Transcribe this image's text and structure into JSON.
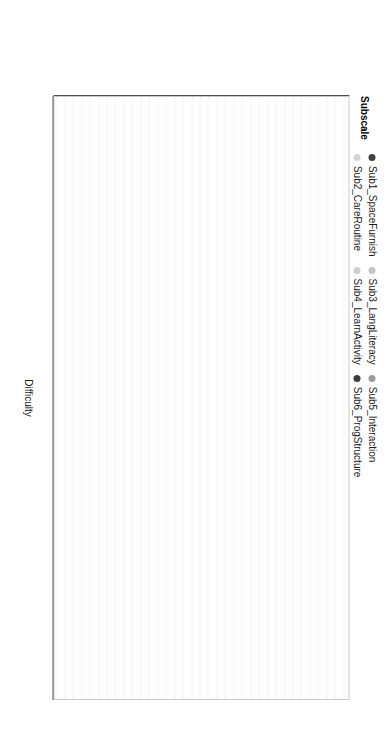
{
  "figure": {
    "xlabel": "Difficulty",
    "xticks": [
      0,
      1,
      2,
      3,
      4
    ],
    "legend_title": "Subscale"
  },
  "legend": {
    "title": "Subscale",
    "entries": [
      {
        "label": "Sub1_SpaceFurnish",
        "color": "#404040"
      },
      {
        "label": "Sub2_CareRoutine",
        "color": "#d4d4d4"
      },
      {
        "label": "Sub3_LangLiteracy",
        "color": "#c4c4c4"
      },
      {
        "label": "Sub4_LearnActivity",
        "color": "#cfcfcf"
      },
      {
        "label": "Sub5_Interaction",
        "color": "#9a9a9a"
      },
      {
        "label": "Sub6_ProgStructure",
        "color": "#3c3c3c"
      }
    ]
  },
  "chart_data": {
    "type": "scatter",
    "title": "",
    "xlabel": "Difficulty",
    "ylabel": "",
    "xlim": [
      -0.75,
      4.45
    ],
    "ylim": [
      0,
      36
    ],
    "grid": true,
    "legend_position": "top",
    "series_key": "Subscale",
    "categories": [
      "Item20_Block",
      "Item22_SScience",
      "Item21_MathNum",
      "Item25_WithNum",
      "Item27_Tech",
      "Item26_Divers",
      "Item19_Dram",
      "Item6_GrossMotSpace",
      "Item5_Display",
      "Item18_Music",
      "Item16_Print",
      "Item2_Furnishing",
      "Item9_Toilet",
      "Item8_Meals",
      "Item3_RoomArrange",
      "Item24_Motor",
      "Item23_Dram2",
      "Item17_Art",
      "Item7_GrossMotEquip",
      "Item15_Vocabulary",
      "Item13_StaffBook",
      "Item34_FreePlay",
      "Item4_Privacy",
      "Item14_EncourCom",
      "Item35_WholeGroupAct",
      "Item12_Logical",
      "Item29_Individualized",
      "Item11_Encourage",
      "Item1_Indoor",
      "Item10_Health",
      "Item28_SuperGrossMot",
      "Item32_Discipline",
      "Item33_Transition",
      "Item30_StaffChildInteract",
      "Item31_PeerInteract"
    ],
    "points": [
      {
        "item": "Item20_Block",
        "difficulty": 4.3,
        "subscale": "Sub4_LearnActivity",
        "color": "#cdcdcd",
        "emphasis": false
      },
      {
        "item": "Item22_SScience",
        "difficulty": 4.22,
        "subscale": "Sub4_LearnActivity",
        "color": "#cdcdcd",
        "emphasis": false
      },
      {
        "item": "Item21_MathNum",
        "difficulty": 4.12,
        "subscale": "Sub4_LearnActivity",
        "color": "#c6c6c6",
        "emphasis": false
      },
      {
        "item": "Item25_WithNum",
        "difficulty": 3.95,
        "subscale": "Sub4_LearnActivity",
        "color": "#c4c4c4",
        "emphasis": false
      },
      {
        "item": "Item27_Tech",
        "difficulty": 3.6,
        "subscale": "Sub4_LearnActivity",
        "color": "#cccccc",
        "emphasis": false
      },
      {
        "item": "Item26_Divers",
        "difficulty": 3.3,
        "subscale": "Sub4_LearnActivity",
        "color": "#c9c9c9",
        "emphasis": false
      },
      {
        "item": "Item19_Dram",
        "difficulty": 3.29,
        "subscale": "Sub6_ProgStructure",
        "color": "#3c3c3c",
        "emphasis": true
      },
      {
        "item": "Item6_GrossMotSpace",
        "difficulty": 3.18,
        "subscale": "Sub6_ProgStructure",
        "color": "#3c3c3c",
        "emphasis": true
      },
      {
        "item": "Item5_Display",
        "difficulty": 2.95,
        "subscale": "Sub2_CareRoutine",
        "color": "#d2d2d2",
        "emphasis": false
      },
      {
        "item": "Item18_Music",
        "difficulty": 2.72,
        "subscale": "Sub4_LearnActivity",
        "color": "#cbcbcb",
        "emphasis": false
      },
      {
        "item": "Item16_Print",
        "difficulty": 2.5,
        "subscale": "Sub5_Interaction",
        "color": "#8f8f8f",
        "emphasis": true
      },
      {
        "item": "Item2_Furnishing",
        "difficulty": 2.42,
        "subscale": "Sub3_LangLiteracy",
        "color": "#c3c3c3",
        "emphasis": false
      },
      {
        "item": "Item9_Toilet",
        "difficulty": 2.39,
        "subscale": "Sub3_LangLiteracy",
        "color": "#c7c7c7",
        "emphasis": false
      },
      {
        "item": "Item8_Meals",
        "difficulty": 2.36,
        "subscale": "Sub2_CareRoutine",
        "color": "#d0d0d0",
        "emphasis": false
      },
      {
        "item": "Item3_RoomArrange",
        "difficulty": 2.33,
        "subscale": "Sub3_LangLiteracy",
        "color": "#c8c8c8",
        "emphasis": false
      },
      {
        "item": "Item24_Motor",
        "difficulty": 2.3,
        "subscale": "Sub5_Interaction",
        "color": "#8c8c8c",
        "emphasis": true
      },
      {
        "item": "Item23_Dram2",
        "difficulty": 2.27,
        "subscale": "Sub2_CareRoutine",
        "color": "#cdcdcd",
        "emphasis": false
      },
      {
        "item": "Item17_Art",
        "difficulty": 2.23,
        "subscale": "Sub4_LearnActivity",
        "color": "#cfcfcf",
        "emphasis": false
      },
      {
        "item": "Item7_GrossMotEquip",
        "difficulty": 1.9,
        "subscale": "Sub6_ProgStructure",
        "color": "#3c3c3c",
        "emphasis": true
      },
      {
        "item": "Item15_Vocabulary",
        "difficulty": 1.86,
        "subscale": "Sub3_LangLiteracy",
        "color": "#c6c6c6",
        "emphasis": false
      },
      {
        "item": "Item13_StaffBook",
        "difficulty": 1.78,
        "subscale": "Sub3_LangLiteracy",
        "color": "#cbcbcb",
        "emphasis": false
      },
      {
        "item": "Item34_FreePlay",
        "difficulty": 1.32,
        "subscale": "Sub1_SpaceFurnish",
        "color": "#404040",
        "emphasis": true
      },
      {
        "item": "Item4_Privacy",
        "difficulty": 1.19,
        "subscale": "Sub1_SpaceFurnish",
        "color": "#404040",
        "emphasis": true
      },
      {
        "item": "Item14_EncourCom",
        "difficulty": 1.15,
        "subscale": "Sub3_LangLiteracy",
        "color": "#c2c2c2",
        "emphasis": false
      },
      {
        "item": "Item35_WholeGroupAct",
        "difficulty": 1.05,
        "subscale": "Sub6_ProgStructure",
        "color": "#3c3c3c",
        "emphasis": true
      },
      {
        "item": "Item12_Logical",
        "difficulty": 1.01,
        "subscale": "Sub3_LangLiteracy",
        "color": "#c4c4c4",
        "emphasis": false
      },
      {
        "item": "Item29_Individualized",
        "difficulty": 0.96,
        "subscale": "Sub3_LangLiteracy",
        "color": "#c9c9c9",
        "emphasis": false
      },
      {
        "item": "Item11_Encourage",
        "difficulty": 0.92,
        "subscale": "Sub2_CareRoutine",
        "color": "#d2d2d2",
        "emphasis": false
      },
      {
        "item": "Item1_Indoor",
        "difficulty": 0.88,
        "subscale": "Sub6_ProgStructure",
        "color": "#3c3c3c",
        "emphasis": true
      },
      {
        "item": "Item10_Health",
        "difficulty": 0.83,
        "subscale": "Sub2_CareRoutine",
        "color": "#cfcfcf",
        "emphasis": false
      },
      {
        "item": "Item28_SuperGrossMot",
        "difficulty": 0.74,
        "subscale": "Sub5_Interaction",
        "color": "#9a9a9a",
        "emphasis": true
      },
      {
        "item": "Item32_Discipline",
        "difficulty": 0.55,
        "subscale": "Sub5_Interaction",
        "color": "#8f8f8f",
        "emphasis": true
      },
      {
        "item": "Item33_Transition",
        "difficulty": -0.3,
        "subscale": "Sub5_Interaction",
        "color": "#8c8c8c",
        "emphasis": true
      },
      {
        "item": "Item30_StaffChildInteract",
        "difficulty": -0.52,
        "subscale": "Sub5_Interaction",
        "color": "#949494",
        "emphasis": true
      },
      {
        "item": "Item31_PeerInteract",
        "difficulty": -0.62,
        "subscale": "Sub5_Interaction",
        "color": "#8f8f8f",
        "emphasis": true
      }
    ]
  }
}
